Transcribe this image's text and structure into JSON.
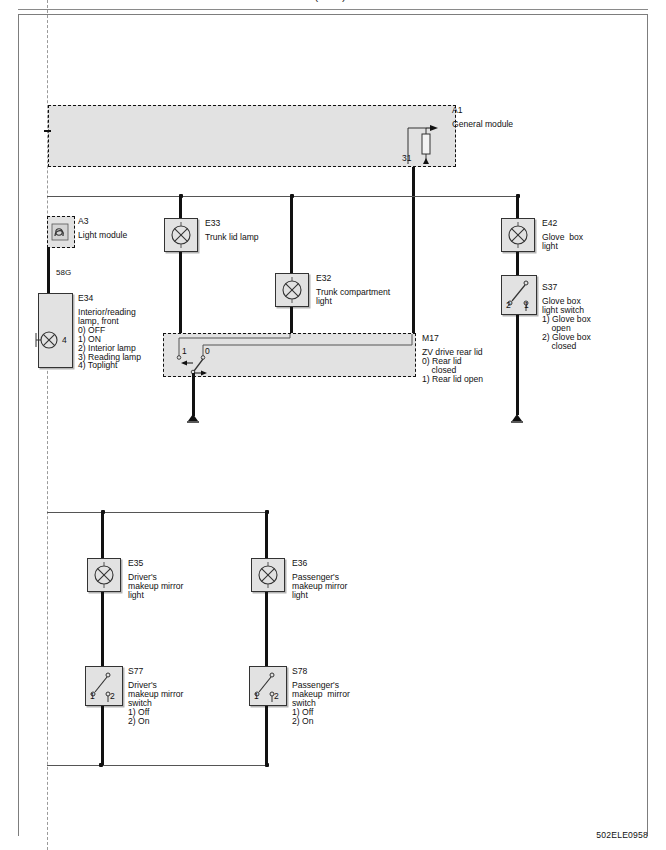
{
  "page": {
    "top_partial_text": "(cont.)",
    "drawing_code": "502ELE0958"
  },
  "modules": {
    "a1": {
      "id": "A1",
      "name": "General module",
      "terminal": "31"
    },
    "a3": {
      "id": "A3",
      "name": "Light module",
      "icon": "light-module-icon"
    },
    "m17": {
      "id": "M17",
      "name": "ZV drive rear lid",
      "states": [
        "0) Rear lid",
        "    closed",
        "1) Rear lid open"
      ],
      "pin_left": "1",
      "pin_right": "0"
    }
  },
  "components": [
    {
      "id": "E33",
      "name": "Trunk lid lamp",
      "type": "lamp",
      "icon": "lamp-icon"
    },
    {
      "id": "E32",
      "name": "Trunk compartment\nlight",
      "type": "lamp",
      "icon": "lamp-icon"
    },
    {
      "id": "E42",
      "name": "Glove  box\nlight",
      "type": "lamp",
      "icon": "lamp-icon"
    },
    {
      "id": "S37",
      "name": "Glove box\nlight switch\n1) Glove box\n    open\n2) Glove box\n    closed",
      "type": "switch",
      "icon": "switch-icon",
      "pin_a": "2",
      "pin_b": "1"
    },
    {
      "id": "E34",
      "name": "Interior/reading\nlamp, front\n0) OFF\n1) ON\n2) Interior lamp\n3) Reading lamp\n4) Toplight",
      "type": "lamp",
      "icon": "lamp-icon",
      "pin": "4"
    },
    {
      "id": "E35",
      "name": "Driver's\nmakeup mirror\nlight",
      "type": "lamp",
      "icon": "lamp-icon"
    },
    {
      "id": "E36",
      "name": "Passenger's\nmakeup mirror\nlight",
      "type": "lamp",
      "icon": "lamp-icon"
    },
    {
      "id": "S77",
      "name": "Driver's\nmakeup mirror\nswitch\n1) Off\n2) On",
      "type": "switch",
      "icon": "switch-icon",
      "pin_a": "1",
      "pin_b": "2"
    },
    {
      "id": "S78",
      "name": "Passenger's\nmakeup  mirror\nswitch\n1) Off\n2) On",
      "type": "switch",
      "icon": "switch-icon",
      "pin_a": "1",
      "pin_b": "2"
    }
  ],
  "wire_labels": {
    "w58g": "58G"
  },
  "colors": {
    "box_fill": "#e2e2e2",
    "wire": "#111111",
    "thin_wire": "#555555",
    "frame": "#7d7d7d"
  }
}
